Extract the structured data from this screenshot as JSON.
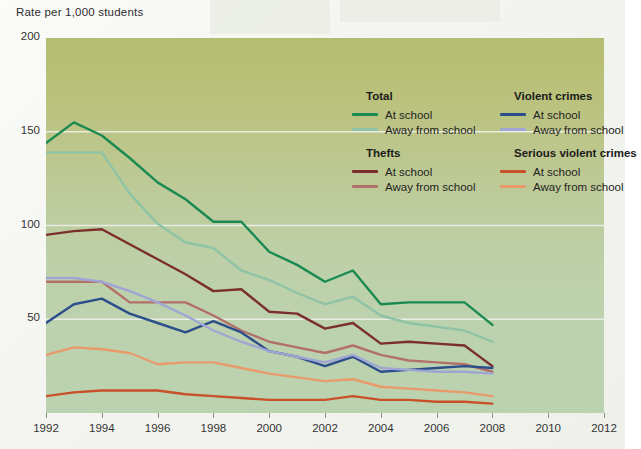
{
  "axis_title": "Rate per 1,000 students",
  "colors": {
    "total_at_school": "#1b8a52",
    "total_away": "#8ec3a6",
    "thefts_at_school": "#7b2f2c",
    "thefts_away": "#b2706a",
    "violent_at_school": "#2c4f8c",
    "violent_away": "#9fa6d4",
    "serious_at_school": "#c8512a",
    "serious_away": "#e89a6b",
    "plot_top": "#b5bd70",
    "plot_bottom": "#bbd2b0",
    "gridline": "#f2f4ee"
  },
  "legend": {
    "groups": [
      {
        "title": "Total",
        "items": [
          {
            "label": "At school",
            "color_key": "total_at_school"
          },
          {
            "label": "Away from school",
            "color_key": "total_away"
          }
        ]
      },
      {
        "title": "Violent crimes",
        "items": [
          {
            "label": "At school",
            "color_key": "violent_at_school"
          },
          {
            "label": "Away from school",
            "color_key": "violent_away"
          }
        ]
      },
      {
        "title": "Thefts",
        "items": [
          {
            "label": "At school",
            "color_key": "thefts_at_school"
          },
          {
            "label": "Away from school",
            "color_key": "thefts_away"
          }
        ]
      },
      {
        "title": "Serious violent crimes",
        "items": [
          {
            "label": "At school",
            "color_key": "serious_at_school"
          },
          {
            "label": "Away from school",
            "color_key": "serious_away"
          }
        ]
      }
    ]
  },
  "chart_data": {
    "type": "line",
    "title": "",
    "xlabel": "",
    "ylabel": "Rate per 1,000 students",
    "xlim": [
      1992,
      2012
    ],
    "ylim": [
      0,
      200
    ],
    "yticks": [
      50,
      100,
      150,
      200
    ],
    "xticks": [
      1992,
      1994,
      1996,
      1998,
      2000,
      2002,
      2004,
      2006,
      2008,
      2010,
      2012
    ],
    "grid": "horizontal",
    "legend_position": "inside-top-right",
    "x": [
      1992,
      1993,
      1994,
      1995,
      1996,
      1997,
      1998,
      1999,
      2000,
      2001,
      2002,
      2003,
      2004,
      2005,
      2006,
      2007,
      2008
    ],
    "series": [
      {
        "name": "Total - At school",
        "color_key": "total_at_school",
        "values": [
          144,
          155,
          148,
          136,
          123,
          114,
          102,
          102,
          86,
          79,
          70,
          76,
          58,
          59,
          59,
          59,
          47
        ]
      },
      {
        "name": "Total - Away from school",
        "color_key": "total_away",
        "values": [
          139,
          139,
          139,
          117,
          101,
          91,
          88,
          76,
          71,
          64,
          58,
          62,
          52,
          48,
          46,
          44,
          38
        ]
      },
      {
        "name": "Thefts - At school",
        "color_key": "thefts_at_school",
        "values": [
          95,
          97,
          98,
          90,
          82,
          74,
          65,
          66,
          54,
          53,
          45,
          48,
          37,
          38,
          37,
          36,
          25
        ]
      },
      {
        "name": "Thefts - Away from school",
        "color_key": "thefts_away",
        "values": [
          70,
          70,
          70,
          59,
          59,
          59,
          52,
          44,
          38,
          35,
          32,
          36,
          31,
          28,
          27,
          26,
          22
        ]
      },
      {
        "name": "Violent crimes - At school",
        "color_key": "violent_at_school",
        "values": [
          48,
          58,
          61,
          53,
          48,
          43,
          49,
          43,
          33,
          30,
          25,
          30,
          22,
          23,
          24,
          25,
          24
        ]
      },
      {
        "name": "Violent crimes - Away from school",
        "color_key": "violent_away",
        "values": [
          72,
          72,
          70,
          65,
          59,
          52,
          44,
          38,
          33,
          30,
          27,
          31,
          24,
          23,
          22,
          22,
          21
        ]
      },
      {
        "name": "Serious violent crimes - At school",
        "color_key": "serious_at_school",
        "values": [
          9,
          11,
          12,
          12,
          12,
          10,
          9,
          8,
          7,
          7,
          7,
          9,
          7,
          7,
          6,
          6,
          5
        ]
      },
      {
        "name": "Serious violent crimes - Away from school",
        "color_key": "serious_away",
        "values": [
          31,
          35,
          34,
          32,
          26,
          27,
          27,
          24,
          21,
          19,
          17,
          18,
          14,
          13,
          12,
          11,
          9
        ]
      }
    ]
  }
}
